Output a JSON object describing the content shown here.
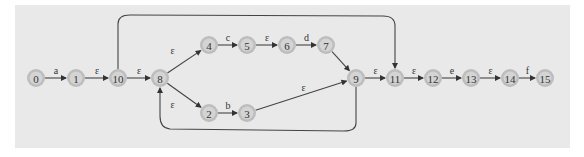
{
  "diagram": {
    "type": "NFA state transition diagram",
    "nodes": [
      {
        "id": "0",
        "x": 36,
        "y": 78
      },
      {
        "id": "1",
        "x": 76,
        "y": 78
      },
      {
        "id": "10",
        "x": 118,
        "y": 78
      },
      {
        "id": "8",
        "x": 160,
        "y": 78
      },
      {
        "id": "4",
        "x": 209,
        "y": 45
      },
      {
        "id": "5",
        "x": 247,
        "y": 45
      },
      {
        "id": "6",
        "x": 287,
        "y": 45
      },
      {
        "id": "7",
        "x": 326,
        "y": 45
      },
      {
        "id": "2",
        "x": 209,
        "y": 113
      },
      {
        "id": "3",
        "x": 247,
        "y": 113
      },
      {
        "id": "9",
        "x": 356,
        "y": 78
      },
      {
        "id": "11",
        "x": 395,
        "y": 78
      },
      {
        "id": "12",
        "x": 433,
        "y": 78
      },
      {
        "id": "13",
        "x": 471,
        "y": 78
      },
      {
        "id": "14",
        "x": 510,
        "y": 78
      },
      {
        "id": "15",
        "x": 545,
        "y": 78
      }
    ],
    "edges": [
      {
        "from": "0",
        "to": "1",
        "label": "a"
      },
      {
        "from": "1",
        "to": "10",
        "label": "ε"
      },
      {
        "from": "10",
        "to": "8",
        "label": "ε"
      },
      {
        "from": "10",
        "to": "11",
        "label": "",
        "curve": "top"
      },
      {
        "from": "8",
        "to": "4",
        "label": "ε"
      },
      {
        "from": "8",
        "to": "2",
        "label": "ε"
      },
      {
        "from": "4",
        "to": "5",
        "label": "c"
      },
      {
        "from": "5",
        "to": "6",
        "label": "ε"
      },
      {
        "from": "6",
        "to": "7",
        "label": "d"
      },
      {
        "from": "7",
        "to": "9",
        "label": ""
      },
      {
        "from": "2",
        "to": "3",
        "label": "b"
      },
      {
        "from": "3",
        "to": "9",
        "label": "ε"
      },
      {
        "from": "9",
        "to": "8",
        "label": "",
        "curve": "bottom"
      },
      {
        "from": "9",
        "to": "11",
        "label": "ε"
      },
      {
        "from": "11",
        "to": "12",
        "label": "ε"
      },
      {
        "from": "12",
        "to": "13",
        "label": "e"
      },
      {
        "from": "13",
        "to": "14",
        "label": "ε"
      },
      {
        "from": "14",
        "to": "15",
        "label": "f"
      }
    ]
  }
}
